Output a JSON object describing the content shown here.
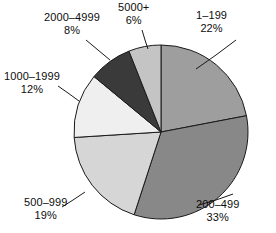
{
  "chart_data": {
    "type": "pie",
    "title": "",
    "subtitle": "",
    "xlabel": "",
    "ylabel": "",
    "legend_position": "none",
    "grid": false,
    "start_angle_deg": 0,
    "direction": "clockwise",
    "categories": [
      "1–199",
      "200–499",
      "500–999",
      "1000–1999",
      "2000–4999",
      "5000+"
    ],
    "values": [
      22,
      33,
      19,
      12,
      8,
      6
    ],
    "value_unit": "%",
    "slices": [
      {
        "label": "1–199",
        "percent": 22,
        "percent_text": "22%",
        "color": "#9e9e9e",
        "start_deg": 0,
        "end_deg": 79.2
      },
      {
        "label": "200–499",
        "percent": 33,
        "percent_text": "33%",
        "color": "#888888",
        "start_deg": 79.2,
        "end_deg": 198.0
      },
      {
        "label": "500–999",
        "percent": 19,
        "percent_text": "19%",
        "color": "#d6d6d6",
        "start_deg": 198.0,
        "end_deg": 266.4
      },
      {
        "label": "1000–1999",
        "percent": 12,
        "percent_text": "12%",
        "color": "#efefef",
        "start_deg": 266.4,
        "end_deg": 309.6
      },
      {
        "label": "2000–4999",
        "percent": 8,
        "percent_text": "8%",
        "color": "#3a3a3a",
        "start_deg": 309.6,
        "end_deg": 338.4
      },
      {
        "label": "5000+",
        "percent": 6,
        "percent_text": "6%",
        "color": "#c4c4c4",
        "start_deg": 338.4,
        "end_deg": 360.0
      }
    ]
  },
  "labels": {
    "s1": {
      "category": "1–199",
      "percent": "22%"
    },
    "s2": {
      "category": "200–499",
      "percent": "33%"
    },
    "s3": {
      "category": "500–999",
      "percent": "19%"
    },
    "s4": {
      "category": "1000–1999",
      "percent": "12%"
    },
    "s5": {
      "category": "2000–4999",
      "percent": "8%"
    },
    "s6": {
      "category": "5000+",
      "percent": "6%"
    }
  }
}
